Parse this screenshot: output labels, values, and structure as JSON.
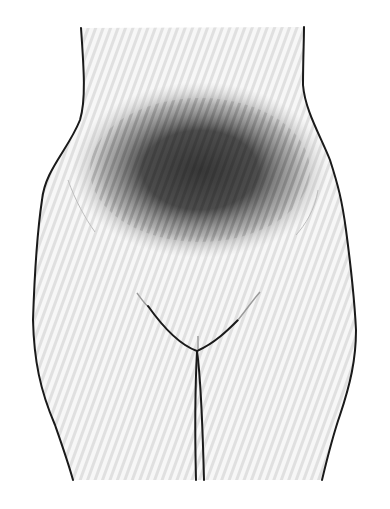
{
  "figure": {
    "colors": {
      "background": "#ffffff",
      "skin_base": "#f7f7f7",
      "stripe": "#e0e0e0",
      "outline": "#1a1a1a",
      "pain_core": "#2e2e2e",
      "faint_line": "#bdbdbd"
    },
    "pain_region": {
      "label": "lower abdomen",
      "center": [
        200,
        170
      ],
      "radii": [
        125,
        85
      ]
    }
  }
}
